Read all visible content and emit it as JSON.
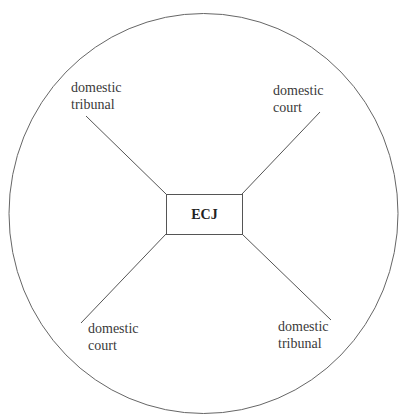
{
  "diagram": {
    "center": {
      "label": "ECJ"
    },
    "nodes": [
      {
        "id": "top-left",
        "line1": "domestic",
        "line2": "tribunal"
      },
      {
        "id": "top-right",
        "line1": "domestic",
        "line2": "court"
      },
      {
        "id": "bottom-left",
        "line1": "domestic",
        "line2": "court"
      },
      {
        "id": "bottom-right",
        "line1": "domestic",
        "line2": "tribunal"
      }
    ],
    "colors": {
      "stroke": "#555555",
      "text": "#3a3a3a"
    }
  }
}
